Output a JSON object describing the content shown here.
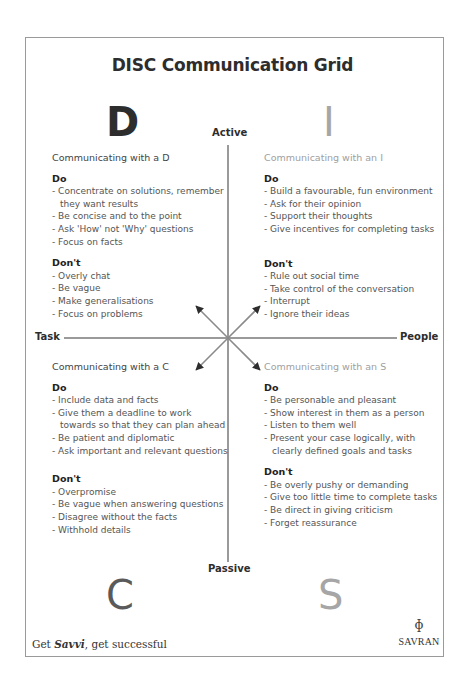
{
  "title": "DISC Communication Grid",
  "letters": {
    "d": "D",
    "i": "I",
    "c": "C",
    "s": "S"
  },
  "axes": {
    "top": "Active",
    "bottom": "Passive",
    "left": "Task",
    "right": "People"
  },
  "colors": {
    "dark": "#2d2d2d",
    "light": "#a6a6a6",
    "frame": "#9a9a9a",
    "line": "#9a9a9a",
    "arrow": "#2d2d2d"
  },
  "quadrants": {
    "d": {
      "heading": "Communicating with a D",
      "do_label": "Do",
      "do": [
        "Concentrate on solutions, remember they want results",
        "Be concise and to the point",
        "Ask 'How' not 'Why' questions",
        "Focus on facts"
      ],
      "dont_label": "Don't",
      "dont": [
        "Overly chat",
        "Be vague",
        "Make generalisations",
        "Focus on problems"
      ]
    },
    "i": {
      "heading": "Communicating with an I",
      "do_label": "Do",
      "do": [
        "Build a favourable, fun environment",
        "Ask for their opinion",
        "Support their thoughts",
        "Give incentives for completing tasks"
      ],
      "dont_label": "Don't",
      "dont": [
        "Rule out social time",
        "Take control of the conversation",
        "Interrupt",
        "Ignore their ideas"
      ]
    },
    "c": {
      "heading": "Communicating with a C",
      "do_label": "Do",
      "do": [
        "Include data and facts",
        "Give them a deadline to work towards so that they can plan ahead",
        "Be patient and diplomatic",
        "Ask important and relevant questions"
      ],
      "dont_label": "Don't",
      "dont": [
        "Overpromise",
        "Be vague when answering questions",
        "Disagree without the facts",
        "Withhold details"
      ]
    },
    "s": {
      "heading": "Communicating with an S",
      "do_label": "Do",
      "do": [
        "Be personable and pleasant",
        "Show interest in them as a person",
        "Listen to them well",
        "Present your case logically, with clearly defined goals and tasks"
      ],
      "dont_label": "Don't",
      "dont": [
        "Be overly pushy or demanding",
        "Give too little time to complete tasks",
        "Be direct in giving criticism",
        "Forget reassurance"
      ]
    }
  },
  "footer": {
    "tagline_prefix": "Get ",
    "tagline_brand": "Savvi",
    "tagline_suffix": ", get successful",
    "brand_mark": "ɸ",
    "brand_name": "SAVRAN"
  }
}
